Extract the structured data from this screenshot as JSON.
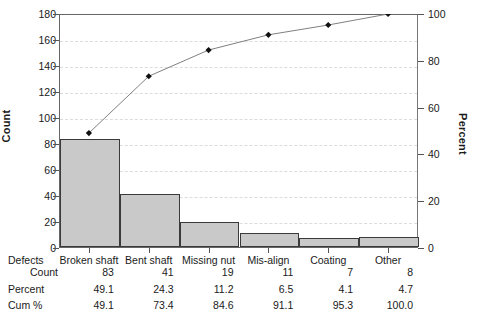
{
  "chart_data": {
    "type": "bar",
    "title": "",
    "subtitle": "",
    "xlabel": "Defects",
    "ylabel": "Count",
    "y2label": "Percent",
    "categories": [
      "Broken shaft",
      "Bent shaft",
      "Missing nut",
      "Mis-align",
      "Coating",
      "Other"
    ],
    "values": [
      83,
      41,
      19,
      11,
      7,
      8
    ],
    "percent": [
      49.1,
      24.3,
      11.2,
      6.5,
      4.1,
      4.7
    ],
    "cum_percent": [
      49.1,
      73.4,
      84.6,
      91.1,
      95.3,
      100.0
    ],
    "ylim": [
      0,
      180
    ],
    "yticks": [
      0,
      20,
      40,
      60,
      80,
      100,
      120,
      140,
      160,
      180
    ],
    "y2lim": [
      0,
      100
    ],
    "y2ticks": [
      0,
      20,
      40,
      60,
      80,
      100
    ],
    "grid": true,
    "legend": "none",
    "series": [
      {
        "name": "Count",
        "type": "bar",
        "values": [
          83,
          41,
          19,
          11,
          7,
          8
        ]
      },
      {
        "name": "Cum %",
        "type": "line",
        "values": [
          49.1,
          73.4,
          84.6,
          91.1,
          95.3,
          100.0
        ]
      }
    ],
    "bar_color": "#c9c9c9",
    "bar_edge_color": "#3a3a3a",
    "line_color": "#808080",
    "marker_color": "#111111",
    "grid_color": "#dcdcdc",
    "axis_color": "#666666"
  },
  "axes": {
    "left_title": "Count",
    "right_title": "Percent",
    "left_ticks": [
      "180",
      "160",
      "140",
      "120",
      "100",
      "80",
      "60",
      "40",
      "20",
      "0"
    ],
    "right_ticks": [
      "100",
      "80",
      "60",
      "40",
      "20",
      "0"
    ]
  },
  "table": {
    "rows": [
      {
        "label": "Defects",
        "indent": false,
        "values": [
          "Broken shaft",
          "Bent shaft",
          "Missing nut",
          "Mis-align",
          "Coating",
          "Other"
        ],
        "header": true
      },
      {
        "label": "Count",
        "indent": true,
        "values": [
          "83",
          "41",
          "19",
          "11",
          "7",
          "8"
        ],
        "header": false
      },
      {
        "label": "Percent",
        "indent": false,
        "values": [
          "49.1",
          "24.3",
          "11.2",
          "6.5",
          "4.1",
          "4.7"
        ],
        "header": false
      },
      {
        "label": "Cum %",
        "indent": false,
        "values": [
          "49.1",
          "73.4",
          "84.6",
          "91.1",
          "95.3",
          "100.0"
        ],
        "header": false
      }
    ]
  }
}
